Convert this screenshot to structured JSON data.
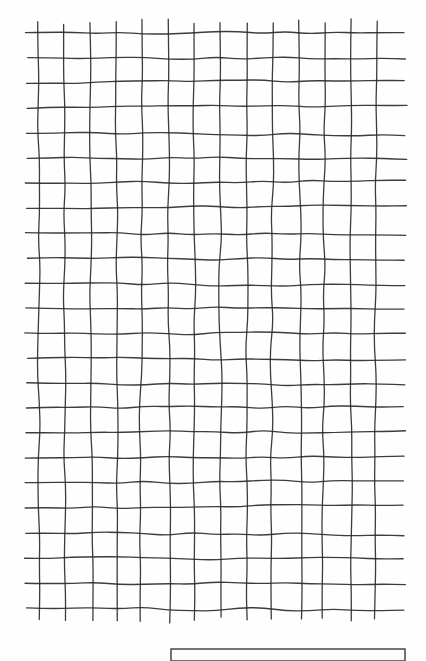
{
  "figure": {
    "kind": "hand-drawn-grid-figure",
    "background_color": "#fefefe",
    "ink_color": "#2b2b2b",
    "caption_box": {
      "label": "caption-box",
      "border_color": "#3a3a3a",
      "x": 171,
      "y": 649,
      "width": 234,
      "height": 12,
      "text": ""
    }
  },
  "chart_data": {
    "type": "heatmap",
    "title": "",
    "subtitle": "",
    "xlabel": "",
    "ylabel": "",
    "grid": true,
    "legend": false,
    "columns": 13,
    "rows": 23,
    "vertical_line_count": 14,
    "horizontal_line_count": 24,
    "cell_width_px": 26.5,
    "cell_height_px": 25,
    "x_extent_px": [
      26,
      405
    ],
    "y_extent_px": [
      22,
      620
    ],
    "vertical_x": [
      38,
      64,
      90,
      116,
      142,
      168,
      194,
      220,
      247,
      273,
      299,
      325,
      351,
      377
    ],
    "horizontal_y": [
      33,
      58,
      83,
      108,
      133,
      158,
      183,
      208,
      233,
      258,
      283,
      308,
      333,
      358,
      383,
      408,
      433,
      458,
      483,
      508,
      533,
      558,
      583,
      608
    ],
    "tick_labels_x": [],
    "tick_labels_y": [],
    "annotations": [],
    "series": []
  }
}
